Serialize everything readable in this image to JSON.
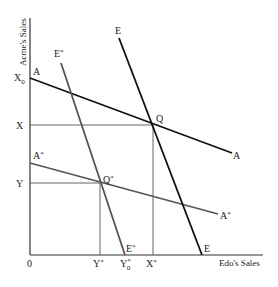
{
  "axes": {
    "x_title": "Edo's Sales",
    "y_title": "Acme's Sales",
    "origin": "0"
  },
  "x_ticks": [
    {
      "label": "Y",
      "sup": "*",
      "sub": ""
    },
    {
      "label": "Y",
      "sup": "*",
      "sub": "0"
    },
    {
      "label": "X",
      "sup": "*",
      "sub": ""
    }
  ],
  "y_ticks": [
    {
      "label": "X",
      "sub": "0"
    },
    {
      "label": "X",
      "sub": ""
    },
    {
      "label": "Y",
      "sub": ""
    }
  ],
  "lines": {
    "A": {
      "start_label": "A",
      "end_label": "A",
      "color": "#111111"
    },
    "A_star": {
      "start_label": "A",
      "end_label": "A",
      "sup": "*",
      "color": "#555555"
    },
    "E": {
      "start_label": "E",
      "end_label": "E",
      "color": "#111111"
    },
    "E_star": {
      "start_label": "E",
      "end_label": "E",
      "sup": "*",
      "color": "#555555"
    }
  },
  "points": {
    "Q": {
      "label": "Q",
      "sup": ""
    },
    "Q_star": {
      "label": "Q",
      "sup": "*"
    }
  },
  "guide_color": "#666666",
  "axis_color": "#333333"
}
